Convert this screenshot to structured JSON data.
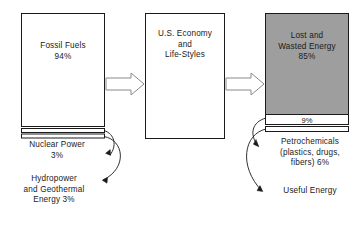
{
  "diagram": {
    "colors": {
      "gray_fill": "#9e9e9e",
      "white_fill": "#ffffff",
      "stroke": "#1a1a1a",
      "arrow_stroke": "#8a8a8a",
      "text": "#1a1a1a"
    },
    "input_column": {
      "main_box": {
        "label": "Fossil Fuels\n94%",
        "name": "Fossil Fuels",
        "percent": "94%"
      },
      "bands": [
        {
          "name": "Nuclear Power",
          "percent": "3%"
        },
        {
          "name": "Hydropower and Geothermal Energy",
          "percent": "3%"
        }
      ],
      "captions": [
        {
          "text": "Nuclear Power\n3%"
        },
        {
          "text": "Hydropower\nand Geothermal\nEnergy   3%"
        }
      ]
    },
    "middle_box": {
      "label": "U.S. Economy\nand\nLife-Styles"
    },
    "output_column": {
      "main_box": {
        "label": "Lost and\nWasted Energy\n85%",
        "name": "Lost and Wasted Energy",
        "percent": "85%"
      },
      "bands": [
        {
          "name": "Petrochemicals",
          "percent": "9%",
          "inline_label": "9%"
        },
        {
          "name": "Useful Energy",
          "percent": "6%"
        }
      ],
      "captions": [
        {
          "text": "Petrochemicals\n(plastics, drugs,\nfibers) 6%"
        },
        {
          "text": "Useful Energy"
        }
      ]
    },
    "flow_arrows": [
      {
        "from": "input_column",
        "to": "middle_box"
      },
      {
        "from": "middle_box",
        "to": "output_column"
      }
    ]
  }
}
